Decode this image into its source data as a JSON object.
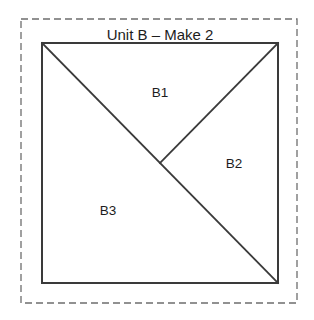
{
  "canvas": {
    "width": 314,
    "height": 320,
    "background_color": "#ffffff"
  },
  "title": {
    "text": "Unit B – Make 2",
    "x": 160,
    "y": 40,
    "color": "#1d1d1d"
  },
  "cut_border": {
    "name": "seam-allowance-dashed-border",
    "x": 21,
    "y": 19,
    "width": 276,
    "height": 284,
    "color": "#6e6e6e",
    "dash": "7 4",
    "stroke_width": 1.3
  },
  "block": {
    "name": "unit-b-square",
    "x": 42,
    "y": 43,
    "width": 236,
    "height": 240,
    "color": "#3a3a3a",
    "stroke_width": 2,
    "fill": "#ffffff"
  },
  "seams": [
    {
      "name": "main-diagonal-seam",
      "x1": 42,
      "y1": 43,
      "x2": 278,
      "y2": 283,
      "color": "#3a3a3a",
      "stroke_width": 1.8
    },
    {
      "name": "upper-right-seam",
      "x1": 278,
      "y1": 43,
      "x2": 160,
      "y2": 163,
      "color": "#3a3a3a",
      "stroke_width": 1.8
    }
  ],
  "patches": [
    {
      "label": "B1",
      "x": 160,
      "y": 97
    },
    {
      "label": "B2",
      "x": 234,
      "y": 168
    },
    {
      "label": "B3",
      "x": 108,
      "y": 215
    }
  ]
}
